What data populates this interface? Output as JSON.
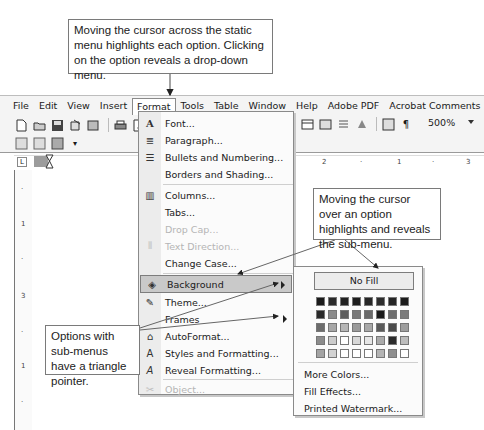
{
  "callouts": {
    "top": "Moving the cursor across the static menu highlights each option. Clicking on the option reveals a drop-down menu.",
    "right": "Moving the cursor over an option highlights and reveals the sub-menu.",
    "left": "Options with sub-menus have a triangle pointer."
  },
  "menubar": {
    "items": [
      {
        "label": "File",
        "icon": null
      },
      {
        "label": "Edit",
        "icon": null
      },
      {
        "label": "View",
        "icon": null
      },
      {
        "label": "Insert",
        "icon": null
      },
      {
        "label": "Format",
        "icon": null,
        "active": true
      },
      {
        "label": "Tools",
        "icon": null
      },
      {
        "label": "Table",
        "icon": null
      },
      {
        "label": "Window",
        "icon": null
      },
      {
        "label": "Help",
        "icon": null
      },
      {
        "label": "Adobe PDF",
        "icon": null
      },
      {
        "label": "Acrobat Comments",
        "icon": null
      }
    ]
  },
  "toolbar": {
    "zoom_value": "500%",
    "paragraph_mark": "¶"
  },
  "ruler": {
    "corner": "L",
    "ticks": [
      "2",
      "·",
      "1",
      "·",
      "3"
    ],
    "vticks": [
      "·",
      "1",
      "·",
      "3",
      "·",
      "1",
      "·"
    ]
  },
  "format_menu": {
    "items": [
      {
        "label": "Font...",
        "icon": "font-icon",
        "glyph": "A"
      },
      {
        "label": "Paragraph...",
        "icon": "paragraph-icon",
        "glyph": "≣"
      },
      {
        "label": "Bullets and Numbering...",
        "icon": "bullets-icon",
        "glyph": "☰"
      },
      {
        "label": "Borders and Shading...",
        "icon": null,
        "glyph": ""
      },
      {
        "label": "Columns...",
        "icon": "columns-icon",
        "glyph": "▥"
      },
      {
        "label": "Tabs...",
        "icon": null,
        "glyph": ""
      },
      {
        "label": "Drop Cap...",
        "icon": null,
        "glyph": "",
        "disabled": true
      },
      {
        "label": "Text Direction...",
        "icon": "text-direction-icon",
        "glyph": "⫴",
        "disabled": true
      },
      {
        "label": "Change Case...",
        "icon": null,
        "glyph": ""
      },
      {
        "label": "Background",
        "icon": "background-icon",
        "glyph": "◈",
        "submenu": true,
        "highlighted": true
      },
      {
        "label": "Theme...",
        "icon": "theme-icon",
        "glyph": "✎"
      },
      {
        "label": "Frames",
        "icon": null,
        "glyph": "",
        "submenu": true
      },
      {
        "label": "AutoFormat...",
        "icon": "autoformat-icon",
        "glyph": "⌂"
      },
      {
        "label": "Styles and Formatting...",
        "icon": "styles-icon",
        "glyph": "A"
      },
      {
        "label": "Reveal Formatting...",
        "icon": "reveal-formatting-icon",
        "glyph": "A"
      },
      {
        "label": "Object...",
        "icon": "object-icon",
        "glyph": "✂",
        "disabled": true
      }
    ]
  },
  "background_submenu": {
    "no_fill": "No Fill",
    "swatches": [
      "#1a1a1a",
      "#2a2a2a",
      "#222222",
      "#1e1e1e",
      "#262626",
      "#2c2c2c",
      "#242424",
      "#1c1c1c",
      "#2a2a2a",
      "#8a8a8a",
      "#5e5e5e",
      "#7a7a7a",
      "#6a6a6a",
      "#1a1a1a",
      "#6e6e6e",
      "#7c7c7c",
      "#6c6c6c",
      "#a6a6a6",
      "#b6b6b6",
      "#9a9a9a",
      "#a8a8a8",
      "#5a5a5a",
      "#4a4a4a",
      "#9e9e9e",
      "#8c8c8c",
      "#cccccc",
      "#ffffff",
      "#d8d8d8",
      "#e6e6e6",
      "#aaaaaa",
      "#2a2a2a",
      "#bdbdbd",
      "#a4a4a4",
      "#d2d2d2",
      "#ffffff",
      "#ffffff",
      "#ffffff",
      "#b4b4b4",
      "#8e8e8e",
      "#ffffff"
    ],
    "items": [
      "More Colors...",
      "Fill Effects...",
      "Printed Watermark..."
    ]
  }
}
